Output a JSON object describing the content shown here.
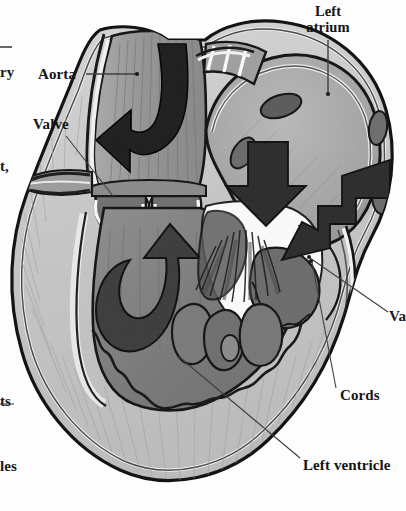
{
  "figure": {
    "style": "hand-drawn pencil shaded anatomical illustration, grayscale",
    "background_color": "#fdfdfd",
    "ink_color": "#141414"
  },
  "labels": [
    {
      "id": "aorta",
      "text": "Aorta",
      "x": 38,
      "y": 66,
      "bold": true,
      "align": "left",
      "leader": "horizontal line right to vessel wall"
    },
    {
      "id": "valve",
      "text": "Valve",
      "x": 33,
      "y": 116,
      "bold": true,
      "align": "left",
      "leader": "diagonal line down-right to aortic valve cusp"
    },
    {
      "id": "left-atrium",
      "text": "Left\natrium",
      "x": 281,
      "y": 4,
      "bold": true,
      "align": "center",
      "leader": "vertical line down to atrial wall"
    },
    {
      "id": "cords",
      "text": "Cords",
      "x": 340,
      "y": 387,
      "bold": true,
      "align": "left",
      "leader": "diagonal line up-left to chordae tendineae"
    },
    {
      "id": "left-ventricle",
      "text": "Left ventricle",
      "x": 303,
      "y": 457,
      "bold": true,
      "align": "left",
      "leader": "diagonal line up-left to ventricular wall"
    }
  ],
  "clipped_labels": [
    {
      "id": "pulmonary-artery-clipped",
      "text": "ry",
      "x": 0,
      "y": 64,
      "note": "left edge cut-off of a longer label"
    },
    {
      "id": "left-clipped",
      "text": "t,",
      "x": 0,
      "y": 158,
      "note": "left edge cut-off of a longer label"
    },
    {
      "id": "papillary-clipped",
      "text": "ts",
      "x": 0,
      "y": 393,
      "note": "left edge cut-off of a longer label"
    },
    {
      "id": "muscles-clipped",
      "text": "les",
      "x": 0,
      "y": 458,
      "note": "left edge cut-off of a longer label"
    },
    {
      "id": "valve-right-clipped",
      "text": "Va",
      "x": 389,
      "y": 308,
      "note": "right edge cut-off of a longer label"
    }
  ],
  "structures": [
    {
      "id": "aorta",
      "name": "Aorta",
      "description": "ascending aorta, shaded vertical vessel top-left"
    },
    {
      "id": "aortic-valve",
      "name": "Aortic valve",
      "description": "two semilunar cusps at base of aorta"
    },
    {
      "id": "left-atrium",
      "name": "Left atrium",
      "description": "dome-shaped chamber upper right with pulmonary vein openings"
    },
    {
      "id": "mitral-valve",
      "name": "Mitral valve",
      "description": "white leaflets between atrium and ventricle"
    },
    {
      "id": "chordae-tendineae",
      "name": "Cords",
      "description": "fine fibrous strands from leaflets to papillary muscles"
    },
    {
      "id": "papillary-muscles",
      "name": "Papillary muscles",
      "description": "rounded muscle mounds on ventricle floor"
    },
    {
      "id": "left-ventricle",
      "name": "Left ventricle",
      "description": "large chamber with thick trabeculated myocardial wall"
    },
    {
      "id": "pulmonary-veins",
      "name": "Pulmonary vein openings",
      "description": "dark oval ostia in atrial wall"
    }
  ],
  "flow_arrows": [
    {
      "id": "aortic-outflow-arrow",
      "shape": "hooked J-curve",
      "direction": "up then out of aorta",
      "color": "#1d1d1d"
    },
    {
      "id": "ventricle-uturn-arrow",
      "shape": "U-turn",
      "direction": "down and around up toward aortic valve",
      "color": "#333333"
    },
    {
      "id": "atrial-inflow-arrow-1",
      "shape": "straight block",
      "direction": "down into mitral valve",
      "color": "#2a2a2a"
    },
    {
      "id": "atrial-inflow-arrow-2",
      "shape": "bent block",
      "direction": "down-left into mitral valve",
      "color": "#2a2a2a"
    }
  ]
}
